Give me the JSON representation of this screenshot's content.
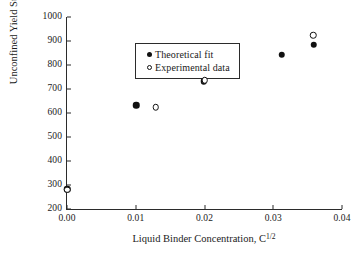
{
  "chart_data": {
    "type": "scatter",
    "title": "",
    "xlabel_plain": "Liquid Binder Concentration, C^1/2",
    "xlabel_main": "Liquid Binder Concentration, C",
    "xlabel_exponent": "1/2",
    "ylabel_plain": "Unconfined Yield Strength, fc (kPa)",
    "ylabel_pre": "Unconfined Yield Strength, f",
    "ylabel_sub": "c",
    "ylabel_post": " (kPa)",
    "xlim": [
      0.0,
      0.04
    ],
    "ylim": [
      200,
      1000
    ],
    "xticks": [
      0.0,
      0.01,
      0.02,
      0.03,
      0.04
    ],
    "xticklabels": [
      "0.00",
      "0.01",
      "0.02",
      "0.03",
      "0.04"
    ],
    "yticks": [
      200,
      300,
      400,
      500,
      600,
      700,
      800,
      900,
      1000
    ],
    "yticklabels": [
      "200",
      "300",
      "400",
      "500",
      "600",
      "700",
      "800",
      "900",
      "1000"
    ],
    "grid": false,
    "legend_position": "upper-left",
    "marker_color": "#111111",
    "axis_color": "#2b2b2b",
    "series": [
      {
        "name": "Theoretical fit",
        "marker": "filled-circle",
        "x": [
          0.0,
          0.0101,
          0.0199,
          0.0312,
          0.0359
        ],
        "y": [
          283,
          633,
          733,
          843,
          885
        ]
      },
      {
        "name": "Experimental data",
        "marker": "open-circle",
        "x": [
          0.0,
          0.0129,
          0.02,
          0.0358
        ],
        "y": [
          280,
          623,
          737,
          923
        ]
      }
    ]
  },
  "legend": {
    "items": [
      {
        "label": "Theoretical fit",
        "marker": "filled-circle"
      },
      {
        "label": "Experimental data",
        "marker": "open-circle"
      }
    ]
  }
}
